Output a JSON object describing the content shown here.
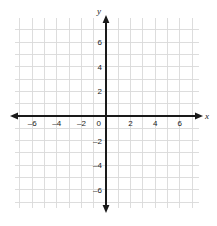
{
  "figure": {
    "kind": "cartesian-coordinate-plane",
    "background_color": "#ffffff",
    "grid_color": "#d9d9d9",
    "axis_color": "#1a1a1a",
    "label_color": "#1a1a1a"
  },
  "axes": {
    "x_axis_label": "x",
    "y_axis_label": "y",
    "origin_label": "0"
  },
  "chart_data": {
    "type": "scatter",
    "title": "",
    "xlabel": "x",
    "ylabel": "y",
    "xlim": [
      -7.4,
      7.6
    ],
    "ylim": [
      -7.5,
      8.0
    ],
    "grid": true,
    "grid_step": 1,
    "legend": "none",
    "series": [],
    "x_ticks": [
      -6,
      -4,
      -2,
      0,
      2,
      4,
      6
    ],
    "x_tick_labels": [
      "–6",
      "–4",
      "–2",
      "0",
      "2",
      "4",
      "6"
    ],
    "y_ticks": [
      -6,
      -4,
      -2,
      2,
      4,
      6
    ],
    "y_tick_labels": [
      "–6",
      "–4",
      "–2",
      "2",
      "4",
      "6"
    ],
    "tick_step": 2,
    "arrows": [
      "left",
      "right",
      "up",
      "down"
    ]
  }
}
